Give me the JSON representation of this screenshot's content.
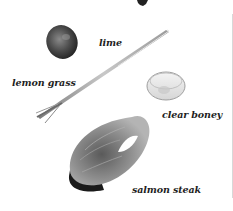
{
  "illustration": {
    "ingredients": [
      {
        "id": "lime",
        "label": "lime"
      },
      {
        "id": "lemon-grass",
        "label": "lemon grass"
      },
      {
        "id": "clear-honey",
        "label": "clear boney"
      },
      {
        "id": "salmon-steak",
        "label": "salmon steak"
      }
    ]
  },
  "colors": {
    "background": "#ffffff",
    "label_text": "#1e1e1e",
    "lime_dark": "#2e2e2e",
    "lime_light": "#8a8a8a",
    "salmon_skin": "#1a1a1a",
    "salmon_flesh": "#8c8c8c"
  }
}
